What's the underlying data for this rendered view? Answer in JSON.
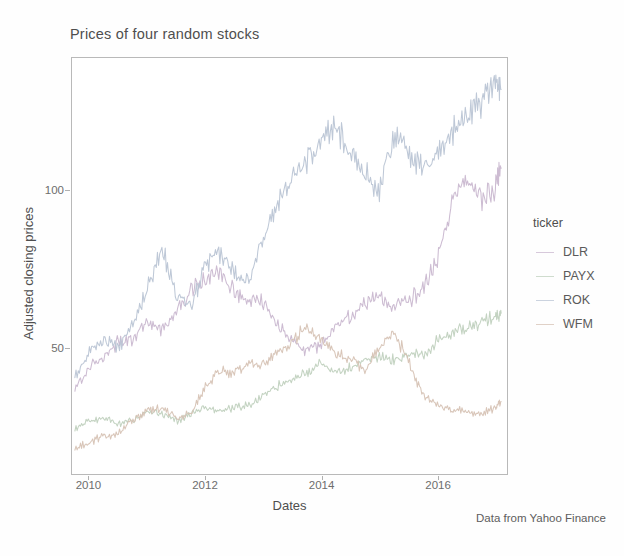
{
  "chart_data": {
    "type": "line",
    "title": "Prices of four random stocks",
    "xlabel": "Dates",
    "ylabel": "Adjusted closing prices",
    "caption": "Data from Yahoo Finance",
    "grid": false,
    "legend_position": "right",
    "legend_title": "ticker",
    "xlim": [
      2009.7,
      2017.2
    ],
    "ylim": [
      10,
      142
    ],
    "xticks": [
      2010,
      2012,
      2014,
      2016
    ],
    "xticklabels": [
      "2010",
      "2012",
      "2014",
      "2016"
    ],
    "yticks": [
      50,
      100
    ],
    "yticklabels": [
      "50",
      "100"
    ],
    "x": [
      2009.75,
      2010.0,
      2010.25,
      2010.5,
      2010.75,
      2011.0,
      2011.25,
      2011.5,
      2011.75,
      2012.0,
      2012.25,
      2012.5,
      2012.75,
      2013.0,
      2013.25,
      2013.5,
      2013.75,
      2014.0,
      2014.25,
      2014.5,
      2014.75,
      2015.0,
      2015.25,
      2015.5,
      2015.75,
      2016.0,
      2016.25,
      2016.5,
      2016.75,
      2017.0,
      2017.1
    ],
    "series": [
      {
        "name": "DLR",
        "color": "#c9b7cf",
        "values": [
          37,
          44,
          47,
          52,
          53,
          58,
          56,
          62,
          68,
          72,
          74,
          68,
          64,
          65,
          57,
          52,
          49,
          51,
          57,
          60,
          64,
          66,
          63,
          65,
          69,
          78,
          96,
          104,
          97,
          101,
          107
        ]
      },
      {
        "name": "PAYX",
        "color": "#bfd0bd",
        "values": [
          24,
          27,
          28,
          26,
          27,
          30,
          29,
          27,
          29,
          31,
          30,
          31,
          32,
          35,
          38,
          40,
          42,
          45,
          42,
          44,
          46,
          47,
          46,
          48,
          48,
          52,
          55,
          56,
          58,
          60,
          61
        ]
      },
      {
        "name": "ROK",
        "color": "#b9c4d4",
        "values": [
          41,
          49,
          53,
          50,
          57,
          69,
          82,
          66,
          63,
          76,
          80,
          74,
          72,
          86,
          97,
          104,
          110,
          116,
          120,
          113,
          105,
          100,
          118,
          113,
          106,
          112,
          118,
          124,
          128,
          136,
          132
        ]
      },
      {
        "name": "WFM",
        "color": "#d6c2b4",
        "values": [
          18,
          20,
          22,
          23,
          27,
          30,
          31,
          28,
          29,
          38,
          43,
          42,
          45,
          45,
          49,
          52,
          57,
          52,
          48,
          47,
          43,
          50,
          55,
          46,
          35,
          32,
          30,
          30,
          29,
          31,
          33
        ]
      }
    ]
  },
  "chart": {
    "title": "Prices of four random stocks",
    "x_axis_title": "Dates",
    "y_axis_title": "Adjusted closing prices",
    "caption": "Data from Yahoo Finance"
  },
  "legend": {
    "title": "ticker",
    "items": [
      {
        "label": "DLR",
        "color": "#c9b7cf"
      },
      {
        "label": "PAYX",
        "color": "#bfd0bd"
      },
      {
        "label": "ROK",
        "color": "#b9c4d4"
      },
      {
        "label": "WFM",
        "color": "#d6c2b4"
      }
    ]
  }
}
